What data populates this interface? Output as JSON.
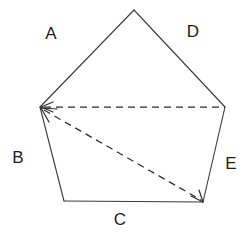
{
  "figure": {
    "background_color": "#ffffff",
    "stroke_color": "#3a3a3a",
    "dash_color": "#2e2e2e",
    "label_color": "#1c1c1c",
    "width": 247,
    "height": 238
  },
  "chart_data": {
    "type": "diagram",
    "shape": "pentagon",
    "title": "",
    "vertices": [
      {
        "id": "apex",
        "x": 134,
        "y": 10
      },
      {
        "id": "left",
        "x": 40,
        "y": 107
      },
      {
        "id": "right",
        "x": 225,
        "y": 107
      },
      {
        "id": "bottom_left",
        "x": 64,
        "y": 201
      },
      {
        "id": "bottom_right",
        "x": 203,
        "y": 202
      }
    ],
    "solid_edges": [
      {
        "label": "A",
        "from": "left",
        "to": "apex"
      },
      {
        "label": "D",
        "from": "apex",
        "to": "right"
      },
      {
        "label": "B",
        "from": "left",
        "to": "bottom_left"
      },
      {
        "label": "C",
        "from": "bottom_left",
        "to": "bottom_right"
      },
      {
        "label": "E",
        "from": "bottom_right",
        "to": "right"
      }
    ],
    "dashed_edges": [
      {
        "from": "left",
        "to": "right",
        "arrow_at": [
          "left"
        ]
      },
      {
        "from": "left",
        "to": "bottom_right",
        "arrow_at": [
          "left",
          "bottom_right"
        ]
      }
    ],
    "labels": [
      {
        "text": "A",
        "x": 51,
        "y": 33
      },
      {
        "text": "D",
        "x": 193,
        "y": 31
      },
      {
        "text": "B",
        "x": 18,
        "y": 157
      },
      {
        "text": "C",
        "x": 120,
        "y": 219
      },
      {
        "text": "E",
        "x": 231,
        "y": 163
      }
    ]
  },
  "paths": {
    "edge_A": "M 40,107 L 134,10",
    "edge_D": "M 134,10 L 225,107",
    "edge_B": "M 40,107 L 64,201",
    "edge_C": "M 64,201 L 203,202",
    "edge_E": "M 203,202 L 225,107",
    "diagonal_horizontal": "M 44,107 L 225,107",
    "diagonal_slanted": "M 44,110 L 201,200",
    "arrow_left_horizontal": "M 53,102 L 41,107 L 53,112",
    "arrow_left_slanted": "M 57,109 L 41,108 L 49,122",
    "arrow_bottom_right": "M 191,196 L 203,202 L 199,190"
  }
}
